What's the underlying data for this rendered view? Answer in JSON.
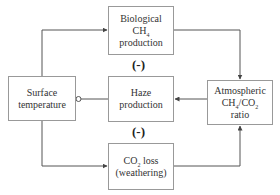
{
  "nodes": {
    "biological": {
      "line1": "Biological",
      "line2_main": "CH",
      "line2_sub": "4",
      "line3": "production"
    },
    "haze": {
      "line1": "Haze",
      "line2": "production"
    },
    "co2loss": {
      "line1_main": "CO",
      "line1_sub": "2",
      "line1_rest": " loss",
      "line2": "(weathering)"
    },
    "surface": {
      "line1": "Surface",
      "line2": "temperature"
    },
    "atmospheric": {
      "line1": "Atmospheric",
      "line2_a": "CH",
      "line2_a_sub": "4",
      "line2_b": "/CO",
      "line2_b_sub": "2",
      "line3": "ratio"
    }
  },
  "signs": {
    "upper": "(-)",
    "lower": "(-)"
  },
  "colors": {
    "line": "#555555",
    "box_border": "#999999"
  }
}
